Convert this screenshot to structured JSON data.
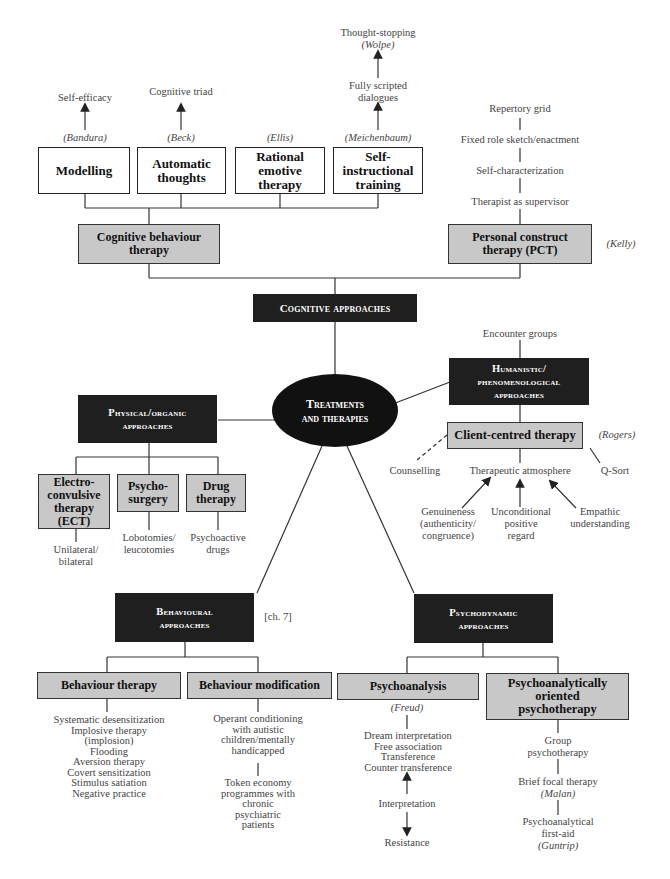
{
  "central": {
    "line1": "Treatments",
    "line2": "and therapies"
  },
  "cognitive": {
    "title": "Cognitive approaches",
    "cbt": {
      "label": "Cognitive behaviour therapy",
      "children": [
        {
          "label": "Modelling",
          "author": "(Bandura)",
          "above": "Self-efficacy"
        },
        {
          "label": "Automatic thoughts",
          "author": "(Beck)",
          "above": "Cognitive triad"
        },
        {
          "label": "Rational emotive therapy",
          "author": "(Ellis)"
        },
        {
          "label": "Self-instructional training",
          "author": "(Meichenbaum)",
          "above": "Fully scripted dialogues",
          "above2": "Thought-stopping",
          "above2_author": "(Wolpe)"
        }
      ]
    },
    "pct": {
      "label": "Personal construct therapy (PCT)",
      "author": "(Kelly)",
      "chain": [
        "Repertory grid",
        "Fixed role sketch/enactment",
        "Self-characterization",
        "Therapist as supervisor"
      ]
    }
  },
  "humanistic": {
    "title_line1": "Humanistic/",
    "title_line2": "phenomenological",
    "title_line3": "approaches",
    "above": "Encounter groups",
    "cct": {
      "label": "Client-centred therapy",
      "author": "(Rogers)"
    },
    "counselling": "Counselling",
    "atmosphere": "Therapeutic atmosphere",
    "qsort": "Q-Sort",
    "conditions": [
      {
        "lines": [
          "Genuineness",
          "(authenticity/",
          "congruence)"
        ]
      },
      {
        "lines": [
          "Unconditional",
          "positive",
          "regard"
        ]
      },
      {
        "lines": [
          "Empathic",
          "understanding"
        ]
      }
    ]
  },
  "physical": {
    "title_line1": "Physical/organic",
    "title_line2": "approaches",
    "children": [
      {
        "label_lines": [
          "Electro-",
          "convulsive",
          "therapy",
          "(ECT)"
        ],
        "below_lines": [
          "Unilateral/",
          "bilateral"
        ]
      },
      {
        "label_lines": [
          "Psycho-",
          "surgery"
        ],
        "below_lines": [
          "Lobotomies/",
          "leucotomies"
        ]
      },
      {
        "label_lines": [
          "Drug",
          "therapy"
        ],
        "below_lines": [
          "Psychoactive",
          "drugs"
        ]
      }
    ]
  },
  "behavioural": {
    "title_line1": "Behavioural",
    "title_line2": "approaches",
    "ref": "[ch. 7]",
    "therapy": {
      "label": "Behaviour therapy",
      "items": [
        "Systematic desensitization",
        "Implosive therapy",
        "(implosion)",
        "Flooding",
        "Aversion therapy",
        "Covert sensitization",
        "Stimulus satiation",
        "Negative practice"
      ]
    },
    "modification": {
      "label": "Behaviour modification",
      "item1_lines": [
        "Operant conditioning",
        "with autistic",
        "children/mentally",
        "handicapped"
      ],
      "item2_lines": [
        "Token economy",
        "programmes with",
        "chronic",
        "psychiatric",
        "patients"
      ]
    }
  },
  "psychodynamic": {
    "title_line1": "Psychodynamic",
    "title_line2": "approaches",
    "psychoanalysis": {
      "label": "Psychoanalysis",
      "author": "(Freud)",
      "items": [
        "Dream interpretation",
        "Free association",
        "Transference",
        "Counter transference"
      ],
      "interpretation": "Interpretation",
      "resistance": "Resistance"
    },
    "oriented": {
      "label_lines": [
        "Psychoanalytically",
        "oriented",
        "psychotherapy"
      ],
      "chain": [
        {
          "lines": [
            "Group",
            "psychotherapy"
          ]
        },
        {
          "lines": [
            "Brief focal therapy"
          ],
          "author": "(Malan)"
        },
        {
          "lines": [
            "Psychoanalytical",
            "first-aid"
          ],
          "author": "(Guntrip)"
        }
      ]
    }
  }
}
